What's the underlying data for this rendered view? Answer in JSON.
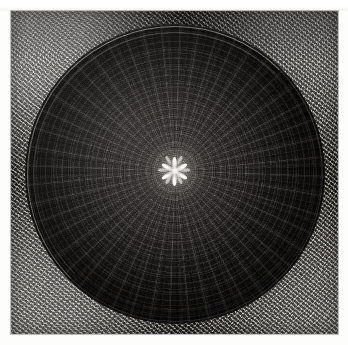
{
  "document": {
    "kind": "photograph",
    "medium": "black-and-white print",
    "subject": "Interior of a muqarnas dome viewed from directly below",
    "orientation": "square, near 1:1",
    "canvas": {
      "width_px": 348,
      "height_px": 345
    },
    "paper_margin_px": 11
  },
  "scene": {
    "structure_type": "hemispherical dome / cupola",
    "decoration_style": "Islamic geometric muqarnas with radiating rosettes",
    "viewpoint": "upward, axis centred",
    "illumination": "dim ambient light, brightest at the apex oculus and the upper-left spandrel",
    "tonal_range": "very low-key; deep blacks across the dome with sparse specular highlights"
  },
  "regions": [
    {
      "id": "spandrel",
      "label": "Corner spandrel stonework",
      "description": "Textured masonry field filling the four corners outside the circular dome, rendered as dense diagonal stalactite cells",
      "relative_brightness": "mid grey, brightest at the upper-left corner"
    },
    {
      "id": "rim",
      "label": "Dome rim cornice",
      "description": "Three concentric thin light arcs marking the base ring of the dome, strongest along the top and left",
      "ring_count": 3
    },
    {
      "id": "dome-field",
      "label": "Dome surface",
      "description": "Deep black concave surface carrying concentric bands of small oval rosette cells that shrink toward the centre",
      "relative_brightness": "darkest near the rim, lifting gradually toward the apex"
    },
    {
      "id": "apex",
      "label": "Apex star medallion",
      "description": "Small radiating star burst of bright petal-shaped highlights at the exact centre of the dome",
      "petal_count": 12
    }
  ],
  "geometry": {
    "dome_center_x_pct": 50,
    "dome_center_y_pct": 50.5,
    "dome_diameter_px": 300,
    "radial_rib_count": 96,
    "concentric_band_count": 18,
    "apex_petal_count": 12
  },
  "palette": {
    "paper_white": "#fdfdfc",
    "spandrel_mid": "#5e5c58",
    "spandrel_highlight": "#b9b6ae",
    "dome_near_apex": "#4a4642",
    "dome_mid": "#1a1816",
    "dome_rim_black": "#080706",
    "rim_line": "#e1ded6",
    "apex_highlight": "#fffdf6"
  }
}
